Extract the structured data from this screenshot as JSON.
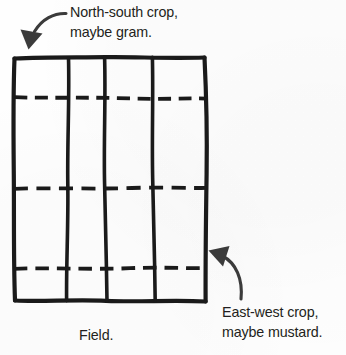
{
  "figure": {
    "caption": "Field.",
    "background_color": "#fefefe",
    "ink_color": "#231f20",
    "annotations": {
      "north_south": {
        "icon": "curved-arrow-down-left-icon",
        "line1": "North-south crop,",
        "line2": "maybe gram.",
        "points_to": "field-top-left-corner"
      },
      "east_west": {
        "icon": "curved-arrow-up-left-icon",
        "line1": "East-west crop,",
        "line2": "maybe mustard.",
        "points_to": "field-right-edge"
      }
    },
    "field": {
      "name": "Field.",
      "solid_vertical_lines": 3,
      "columns": 4,
      "dashed_horizontal_lines": 3,
      "rows": 4,
      "style": "hand-drawn-sketch"
    }
  }
}
